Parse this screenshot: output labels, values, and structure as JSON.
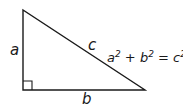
{
  "diagram": {
    "labels": {
      "leg_vertical": "a",
      "leg_horizontal": "b",
      "hypotenuse": "c"
    },
    "equation": {
      "a": "a",
      "b": "b",
      "c": "c",
      "exp": "2",
      "plus": " + ",
      "equals": " = "
    },
    "colors": {
      "stroke": "#1a1a1a",
      "background": "#ffffff"
    }
  }
}
